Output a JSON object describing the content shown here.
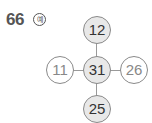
{
  "problem": {
    "number": "66",
    "example_label": "예"
  },
  "diagram": {
    "center": "31",
    "top": "12",
    "left": "11",
    "right": "26",
    "bottom": "25"
  }
}
